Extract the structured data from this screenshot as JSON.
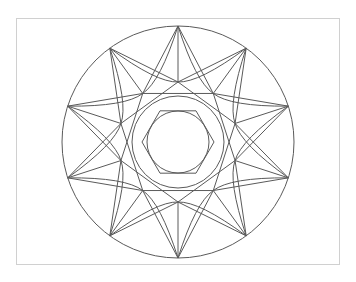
{
  "figure": {
    "frame": {
      "x": 16,
      "y": 18,
      "width": 324,
      "height": 247,
      "border_color": "#d0d0d0"
    },
    "line_color": "#5a5a5a",
    "center": {
      "x": 178,
      "y": 142
    },
    "outer_circle_radius": 116,
    "star": {
      "points": 10,
      "start_angle_deg": -90,
      "outer_radius": 116,
      "inner_radius": 60
    },
    "ring_outer_radius": 46,
    "ring_inner_radius": 31,
    "hexagon": {
      "sides": 6,
      "circumradius": 36,
      "start_angle_deg": 0
    }
  }
}
